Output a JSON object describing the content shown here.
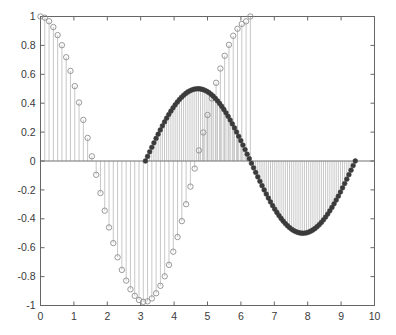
{
  "chart_data": {
    "type": "line",
    "plot_style": "stem",
    "title": "",
    "xlabel": "",
    "ylabel": "",
    "xlim": [
      0,
      10
    ],
    "ylim": [
      -1,
      1
    ],
    "xticks": [
      0,
      1,
      2,
      3,
      4,
      5,
      6,
      7,
      8,
      9,
      10
    ],
    "xtick_labels": [
      "0",
      "1",
      "2",
      "3",
      "4",
      "5",
      "6",
      "7",
      "8",
      "9",
      "10"
    ],
    "yticks": [
      -1,
      -0.8,
      -0.6,
      -0.4,
      -0.2,
      0,
      0.2,
      0.4,
      0.6,
      0.8,
      1
    ],
    "ytick_labels": [
      "-1",
      "-0.8",
      "-0.6",
      "-0.4",
      "-0.2",
      "0",
      "0.2",
      "0.4",
      "0.6",
      "0.8",
      "1"
    ],
    "grid": false,
    "legend": null,
    "baseline_y": 0,
    "colors": {
      "series_a_marker_edge": "#8d8d8d",
      "series_a_marker_face": "none",
      "series_a_stem": "#b9b9b9",
      "series_b_marker_edge": "#3b3b3b",
      "series_b_marker_face": "#3b3b3b",
      "series_b_stem": "#b9b9b9",
      "axis": "#666666",
      "background": "#ffffff"
    },
    "series": [
      {
        "name": "series-a",
        "marker": "open-circle",
        "marker_size": 4.6,
        "x_start": 0.0,
        "x_end": 6.283185307179586,
        "n_points": 50,
        "formula": "cos(x)",
        "x": [
          0.0,
          0.128228,
          0.256457,
          0.384685,
          0.512913,
          0.641141,
          0.76937,
          0.897598,
          1.025826,
          1.154054,
          1.282283,
          1.410511,
          1.538739,
          1.666968,
          1.795196,
          1.923424,
          2.051652,
          2.179881,
          2.308109,
          2.436337,
          2.564565,
          2.692794,
          2.821022,
          2.94925,
          3.077479,
          3.205707,
          3.333935,
          3.462163,
          3.590392,
          3.71862,
          3.846848,
          3.975076,
          4.103305,
          4.231533,
          4.359761,
          4.48799,
          4.616218,
          4.744446,
          4.872674,
          5.000903,
          5.129131,
          5.257359,
          5.385587,
          5.513816,
          5.642044,
          5.770272,
          5.898501,
          6.026729,
          6.154957,
          6.283185
        ],
        "y": [
          1.0,
          0.99179,
          0.96729,
          0.92691,
          0.87131,
          0.80141,
          0.71836,
          0.62349,
          0.51839,
          0.40478,
          0.28455,
          0.15969,
          0.0323,
          -0.09549,
          -0.22152,
          -0.34365,
          -0.45981,
          -0.56806,
          -0.66655,
          -0.75363,
          -0.82783,
          -0.88792,
          -0.93289,
          -0.96201,
          -0.97484,
          -0.97118,
          -0.95115,
          -0.91511,
          -0.86372,
          -0.79789,
          -0.71874,
          -0.62764,
          -0.52612,
          -0.41593,
          -0.2989,
          -0.177,
          -0.05226,
          0.07322,
          0.19735,
          0.31806,
          0.43334,
          0.54128,
          0.64009,
          0.72817,
          0.80411,
          0.86671,
          0.91503,
          0.94838,
          0.96633,
          1.0
        ]
      },
      {
        "name": "series-b",
        "marker": "filled-circle",
        "marker_size": 4.2,
        "x_start": 3.141592653589793,
        "x_end": 9.42477796076938,
        "n_points": 100,
        "formula": "0.5*sin(x - pi)",
        "x_note": "100 evenly spaced points from pi to 3pi",
        "y_note": "half-amplitude sine: minimum -0.5 near x=4.71, zero near x=6.28, maximum 0.5 near x=7.85, zero at x=9.42"
      }
    ]
  },
  "figure": {
    "background": "#ffffff",
    "frame_visible": true
  }
}
